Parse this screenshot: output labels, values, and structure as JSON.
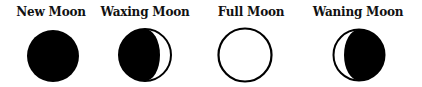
{
  "phases": [
    {
      "label": "New Moon",
      "icon": "new-moon-icon",
      "label_center_x": 51,
      "center_x": 53,
      "center_y": 56,
      "radius": 26
    },
    {
      "label": "Waxing Moon",
      "icon": "waxing-moon-icon",
      "label_center_x": 145,
      "center_x": 145,
      "center_y": 55,
      "radius": 27
    },
    {
      "label": "Full Moon",
      "icon": "full-moon-icon",
      "label_center_x": 251,
      "center_x": 245,
      "center_y": 55,
      "radius": 27
    },
    {
      "label": "Waning Moon",
      "icon": "waning-moon-icon",
      "label_center_x": 358,
      "center_x": 359,
      "center_y": 55,
      "radius": 26
    }
  ],
  "colors": {
    "fill": "#000000",
    "background": "#ffffff",
    "text": "#111111"
  }
}
